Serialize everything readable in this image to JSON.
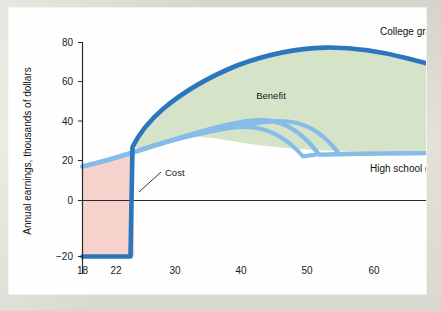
{
  "figure": {
    "background_color": "#dcdcd4",
    "card_color": "#fefefe"
  },
  "chart_data": {
    "type": "area",
    "title": "",
    "subtitle": "",
    "xlabel": "Age",
    "ylabel": "Annual earnings, thousands of dollars",
    "xlim": [
      18,
      71
    ],
    "ylim": [
      -20,
      85
    ],
    "xticks": [
      18,
      22,
      30,
      40,
      50,
      60,
      70
    ],
    "xticklabels": [
      "18",
      "22",
      "30",
      "40",
      "50",
      "60",
      "70"
    ],
    "yticks": [
      -20,
      0,
      20,
      40,
      60,
      80
    ],
    "yticklabels": [
      "−20",
      "0",
      "20",
      "40",
      "60",
      "80"
    ],
    "grid": false,
    "legend_position": "inline-right",
    "colors": {
      "college_line": "#2b76bd",
      "highschool_line": "#86bce8",
      "benefit_fill": "#d5e3c8",
      "cost_fill": "#f5d2cc",
      "zero_line": "#2a2a2a",
      "axis_line": "#2a2a2a"
    },
    "series": [
      {
        "name": "College graduate",
        "label": "College graduate",
        "color": "#2b76bd",
        "x": [
          18,
          19,
          20,
          21,
          21.9,
          22,
          23,
          24,
          26,
          28,
          30,
          33,
          36,
          40,
          44,
          48,
          50,
          54,
          58,
          62,
          66,
          70.5
        ],
        "values": [
          -20,
          -20,
          -20,
          -20,
          -20,
          28,
          34,
          39,
          47,
          53,
          58,
          64,
          69,
          74,
          77.5,
          79.5,
          79.5,
          78,
          75.5,
          72.5,
          69.5,
          66
        ]
      },
      {
        "name": "High school graduate",
        "label": "High school graduate",
        "color": "#86bce8",
        "x": [
          18,
          20,
          22,
          24,
          26,
          28,
          30,
          33,
          36,
          40,
          44,
          48,
          52,
          56,
          60,
          64,
          68,
          70.5
        ],
        "values": [
          18.5,
          21,
          23.5,
          25.5,
          27.5,
          29.5,
          31,
          33.5,
          35.5,
          38,
          39.8,
          41,
          41.6,
          42,
          42.2,
          42.3,
          42.3,
          42.3
        ]
      }
    ],
    "annotations": [
      {
        "name": "benefit",
        "text": "Benefit",
        "description": "Green shaded area between the college graduate and high school graduate earnings curves after age 22"
      },
      {
        "name": "cost",
        "text": "Cost",
        "description": "Pink shaded area below the high school graduate curve and above −20 between ages 18 and 22, with a leader line pointing into the region"
      }
    ]
  }
}
